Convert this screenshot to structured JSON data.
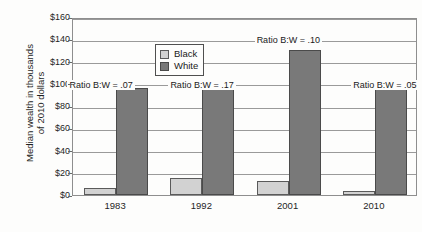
{
  "chart_data": {
    "type": "bar",
    "title": "",
    "clipped_title": "",
    "xlabel": "",
    "ylabel": "Median wealth in thousands of 2010 dollars",
    "ylabel_lines": [
      "Median wealth in thousands",
      "of 2010 dollars"
    ],
    "categories": [
      "1983",
      "1992",
      "2001",
      "2010"
    ],
    "series": [
      {
        "name": "Black",
        "color": "#d2d2d2",
        "values": [
          6,
          15.5,
          13,
          4
        ]
      },
      {
        "name": "White",
        "color": "#797979",
        "values": [
          96,
          95,
          130,
          96
        ]
      }
    ],
    "ylim": [
      0,
      160
    ],
    "ytick_values": [
      0,
      20,
      40,
      60,
      80,
      100,
      120,
      140,
      160
    ],
    "ytick_labels": [
      "$0",
      "$20",
      "$40",
      "$60",
      "$80",
      "$100",
      "$120",
      "$140",
      "$160"
    ],
    "grid": true,
    "legend_position": "upper left inside",
    "annotations": [
      {
        "text": "Ratio B:W = .07",
        "category": "1983",
        "y_value": 100
      },
      {
        "text": "Ratio B:W = .17",
        "category": "1992",
        "y_value": 100
      },
      {
        "text": "Ratio B:W = .10",
        "category": "2001",
        "y_value": 140
      },
      {
        "text": "Ratio B:W = .05",
        "category": "2010",
        "y_value": 100
      }
    ]
  },
  "legend": {
    "items": [
      {
        "label": "Black",
        "swatch": "legend-swatch-black"
      },
      {
        "label": "White",
        "swatch": "legend-swatch-white"
      }
    ]
  },
  "axes": {
    "y": {
      "labels": [
        "$160",
        "$140",
        "$120",
        "$100",
        "$80",
        "$60",
        "$40",
        "$20",
        "$0"
      ],
      "title_line1": "Median wealth in thousands",
      "title_line2": "of 2010 dollars"
    },
    "x": {
      "labels": [
        "1983",
        "1992",
        "2001",
        "2010"
      ]
    }
  },
  "annotations": {
    "items": [
      "Ratio B:W = .07",
      "Ratio B:W = .17",
      "Ratio B:W = .10",
      "Ratio B:W = .05"
    ]
  }
}
